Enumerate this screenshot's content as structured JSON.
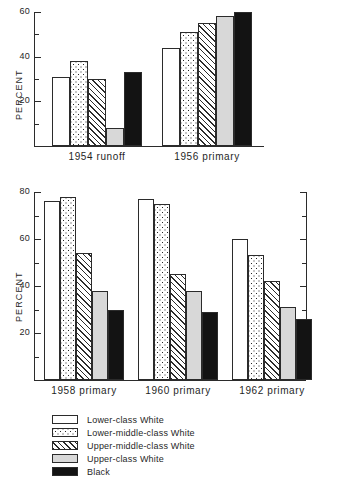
{
  "chart_data": [
    {
      "type": "bar",
      "panel": "top",
      "title": "",
      "xlabel": "",
      "ylabel": "PERCENT",
      "ylim": [
        0,
        60
      ],
      "ytick_labels": [
        "60",
        "40",
        "20"
      ],
      "ytick_values": [
        60,
        40,
        20
      ],
      "yticks_all": [
        10,
        20,
        30,
        40,
        50,
        60
      ],
      "grid": false,
      "categories": [
        "1954 runoff",
        "1956 primary"
      ],
      "series": [
        {
          "name": "Lower-class White",
          "values": [
            31,
            44
          ]
        },
        {
          "name": "Lower-middle-class White",
          "values": [
            38,
            51
          ]
        },
        {
          "name": "Upper-middle-class White",
          "values": [
            30,
            55
          ]
        },
        {
          "name": "Upper-class White",
          "values": [
            8,
            58
          ]
        },
        {
          "name": "Black",
          "values": [
            33,
            60
          ]
        }
      ]
    },
    {
      "type": "bar",
      "panel": "bottom",
      "title": "",
      "xlabel": "",
      "ylabel": "PERCENT",
      "ylim": [
        0,
        80
      ],
      "ytick_labels": [
        "80",
        "60",
        "40",
        "20"
      ],
      "ytick_values": [
        80,
        60,
        40,
        20
      ],
      "yticks_all": [
        10,
        20,
        30,
        40,
        50,
        60,
        70,
        80
      ],
      "grid": false,
      "categories": [
        "1958 primary",
        "1960 primary",
        "1962 primary"
      ],
      "series": [
        {
          "name": "Lower-class White",
          "values": [
            76,
            77,
            60
          ]
        },
        {
          "name": "Lower-middle-class White",
          "values": [
            78,
            75,
            53
          ]
        },
        {
          "name": "Upper-middle-class White",
          "values": [
            54,
            45,
            42
          ]
        },
        {
          "name": "Upper-class White",
          "values": [
            38,
            38,
            31
          ]
        },
        {
          "name": "Black",
          "values": [
            30,
            29,
            26
          ]
        }
      ]
    }
  ],
  "legend": {
    "position": "below",
    "items": [
      {
        "label": "Lower-class White",
        "pattern": "open"
      },
      {
        "label": "Lower-middle-class White",
        "pattern": "dots"
      },
      {
        "label": "Upper-middle-class White",
        "pattern": "hatch"
      },
      {
        "label": "Upper-class White",
        "pattern": "stipple"
      },
      {
        "label": "Black",
        "pattern": "solid"
      }
    ]
  }
}
